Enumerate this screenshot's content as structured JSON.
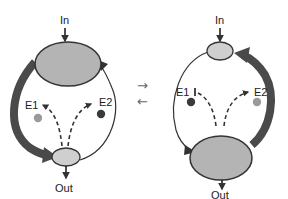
{
  "diagram": {
    "left_state": {
      "input_label": "In",
      "output_label": "Out",
      "enzyme_1_label": "E1",
      "enzyme_2_label": "E2",
      "large_pool": "top",
      "thick_flux_side": "left",
      "enzyme_1_color": "#9a9a9a",
      "enzyme_2_color": "#3a3a3a",
      "enzyme_1_arrow": "arrow",
      "enzyme_2_arrow": "arrow"
    },
    "right_state": {
      "input_label": "In",
      "output_label": "Out",
      "enzyme_1_label": "E1",
      "enzyme_2_label": "E2",
      "large_pool": "bottom",
      "thick_flux_side": "right",
      "enzyme_1_color": "#3a3a3a",
      "enzyme_2_color": "#9a9a9a",
      "enzyme_1_arrow": "inhibit",
      "enzyme_2_arrow": "arrow"
    },
    "transition": {
      "forward_symbol": "→",
      "reverse_symbol": "←"
    },
    "colors": {
      "pool_fill": "#b4b4b4",
      "small_pool_fill": "#cfcfcf",
      "outline": "#333333",
      "thick_arrow": "#4a4a4a"
    }
  }
}
